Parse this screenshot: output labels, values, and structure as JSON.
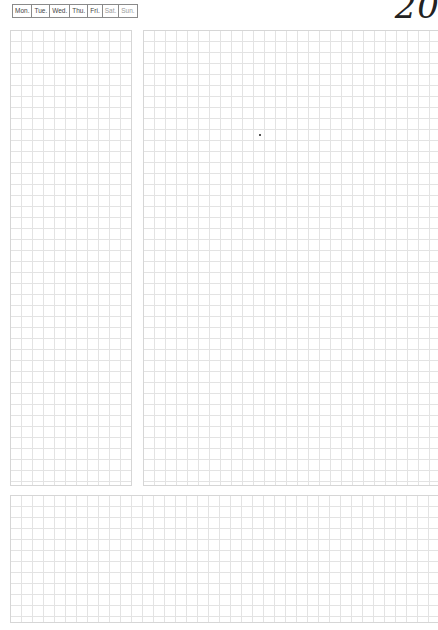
{
  "header": {
    "weekdays": [
      {
        "label": "Mon.",
        "weekend": false
      },
      {
        "label": "Tue.",
        "weekend": false
      },
      {
        "label": "Wed.",
        "weekend": false
      },
      {
        "label": "Thu.",
        "weekend": false
      },
      {
        "label": "Fri.",
        "weekend": false
      },
      {
        "label": "Sat.",
        "weekend": true
      },
      {
        "label": "Sun.",
        "weekend": true
      }
    ],
    "date_number": "20"
  },
  "panels": {
    "left": {
      "type": "grid"
    },
    "right": {
      "type": "grid"
    },
    "bottom": {
      "type": "grid"
    }
  },
  "colors": {
    "grid_line": "#e3e3e3",
    "panel_border": "#d6d6d6",
    "weekday_text": "#444444",
    "weekend_text": "#9a9a9a",
    "date_text": "#222222"
  }
}
